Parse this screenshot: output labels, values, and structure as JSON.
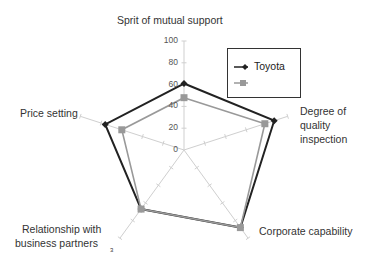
{
  "chart_data": {
    "type": "radar",
    "title": "",
    "categories": [
      "Sprit of mutual support",
      "Degree of quality inspection",
      "Corporate capability",
      "Relationship with business partners",
      "Price setting"
    ],
    "series": [
      {
        "name": "Toyota",
        "values": [
          61,
          87,
          88,
          67,
          76
        ],
        "color": "#222222",
        "marker": "diamond"
      },
      {
        "name": "",
        "values": [
          48,
          78,
          88,
          67,
          60
        ],
        "color": "#999999",
        "marker": "square"
      }
    ],
    "rlim": [
      0,
      100
    ],
    "ticks": [
      "0",
      "20",
      "40",
      "60",
      "80",
      "100"
    ],
    "legend_position": "upper right",
    "stray_label": "3"
  },
  "labels": {
    "axis0": "Sprit of mutual support",
    "axis1a": "Degree of",
    "axis1b": "quality",
    "axis1c": "inspection",
    "axis2": "Corporate capability",
    "axis3a": "Relationship with",
    "axis3b": "business partners",
    "axis4": "Price setting"
  },
  "legend": {
    "s1": "Toyota",
    "s2": ""
  }
}
